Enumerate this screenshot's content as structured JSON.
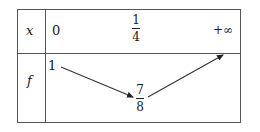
{
  "variation_table": {
    "variable_label": "x",
    "function_label": "f",
    "x_values": {
      "start": "0",
      "middle": {
        "numerator": "1",
        "denominator": "4"
      },
      "end": "+∞"
    },
    "f_values": {
      "start": "1",
      "minimum": {
        "numerator": "7",
        "denominator": "8"
      }
    },
    "arrows": [
      {
        "direction": "decreasing",
        "from": "1",
        "to": "7/8"
      },
      {
        "direction": "increasing",
        "from": "7/8",
        "to": "+∞"
      }
    ],
    "line_color": "#555555",
    "text_color": "#1a1a1a"
  }
}
